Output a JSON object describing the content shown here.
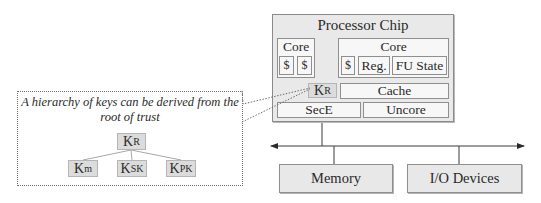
{
  "chip": {
    "title": "Processor Chip",
    "core_small": {
      "label": "Core",
      "caches": [
        "$",
        "$"
      ]
    },
    "core_large": {
      "label": "Core",
      "cache": "$",
      "reg": "Reg.",
      "fu_state": "FU State"
    },
    "root_key": {
      "base": "K",
      "sub": "R"
    },
    "cache": "Cache",
    "sece": "SecE",
    "uncore": "Uncore"
  },
  "bus": {
    "memory": "Memory",
    "io": "I/O Devices"
  },
  "callout": {
    "caption_line1": "A hierarchy of keys can be derived from the",
    "caption_line2": "root of trust",
    "tree": {
      "root": {
        "base": "K",
        "sub": "R"
      },
      "children": [
        {
          "base": "K",
          "sub": "m"
        },
        {
          "base": "K",
          "sub": "SK"
        },
        {
          "base": "K",
          "sub": "PK"
        }
      ]
    }
  },
  "colors": {
    "box_fill": "#e8e8e8",
    "key_fill": "#dcdcdc",
    "line": "#3a3a3a",
    "dotted": "#6f6f6f"
  }
}
